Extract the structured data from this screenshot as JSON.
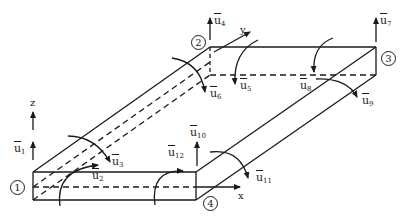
{
  "figure": {
    "stroke_color": "#1a1a1a",
    "background": "#ffffff"
  },
  "axes": {
    "x": "x",
    "y": "y",
    "z": "z"
  },
  "nodes": [
    {
      "id": "1",
      "label": "1"
    },
    {
      "id": "2",
      "label": "2"
    },
    {
      "id": "3",
      "label": "3"
    },
    {
      "id": "4",
      "label": "4"
    }
  ],
  "dofs": [
    {
      "base": "u",
      "sub": "1"
    },
    {
      "base": "u",
      "sub": "2"
    },
    {
      "base": "u",
      "sub": "3"
    },
    {
      "base": "u",
      "sub": "4"
    },
    {
      "base": "u",
      "sub": "5"
    },
    {
      "base": "u",
      "sub": "6"
    },
    {
      "base": "u",
      "sub": "7"
    },
    {
      "base": "u",
      "sub": "8"
    },
    {
      "base": "u",
      "sub": "9"
    },
    {
      "base": "u",
      "sub": "10"
    },
    {
      "base": "u",
      "sub": "11"
    },
    {
      "base": "u",
      "sub": "12"
    }
  ]
}
